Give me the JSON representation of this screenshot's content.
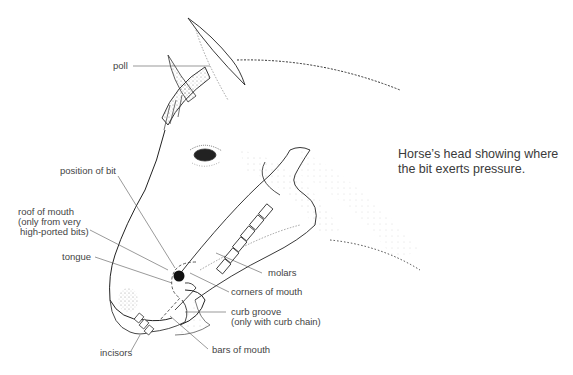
{
  "caption": {
    "line1": "Horse’s head showing where",
    "line2": "the bit exerts pressure."
  },
  "labels": {
    "poll": "poll",
    "position_of_bit": "position of bit",
    "roof_of_mouth": {
      "line1": "roof of mouth",
      "line2": "(only from very",
      "line3": "high-ported bits)"
    },
    "tongue": "tongue",
    "incisors": "incisors",
    "molars": "molars",
    "corners_of_mouth": "corners of mouth",
    "curb_groove": {
      "line1": "curb groove",
      "line2": "(only with curb chain)"
    },
    "bars_of_mouth": "bars of mouth"
  },
  "colors": {
    "ink": "#2a2a2a",
    "leader": "#555555",
    "bit": "#111111"
  }
}
